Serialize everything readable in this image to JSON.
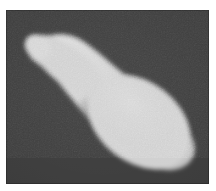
{
  "figure": {
    "caption": "",
    "alt_text": "Grayscale image of a light club-shaped blob on a dark gray background",
    "domain_kind": "grayscale-photograph"
  },
  "canvas": {
    "width": 216,
    "height": 191,
    "page_background": "#ffffff",
    "margin_left": 6,
    "margin_top": 10,
    "margin_right": 7,
    "margin_bottom": 7
  },
  "plate": {
    "x": 6,
    "y": 10,
    "width": 203,
    "height": 174,
    "background_color": "#3c3c3c",
    "noise_opacity": 0.42,
    "has_vignette": true,
    "edge_shadow": "rgba(0,0,0,0.22)"
  },
  "blob": {
    "name": "club-shaped-blob",
    "fill_color": "#cdcdcd",
    "fill_color_highlight": "#d8d8d8",
    "fill_color_shadow": "#bdbdbd",
    "edge_softness_px": 2.2,
    "orientation_degrees": 38,
    "description": "Elongated bulbous form resembling a bowling pin or club, thin rounded handle at upper-left tapering through a narrow neck into a broad rounded bulb at lower-right",
    "bounding_box": {
      "x": 16,
      "y": 24,
      "width": 175,
      "height": 135
    },
    "handle_tip": {
      "x": 22,
      "y": 32
    },
    "bulb_center": {
      "x": 135,
      "y": 110
    },
    "outline_path": "M 40.0 27.5 C 52.0 22.5 66.0 24.5 76.5 31.5 C 88.0 39.0 100.0 50.0 112.0 60.0 C 126.0 71.5 142.0 81.5 156.0 93.0 C 170.0 104.5 182.0 117.0 186.5 130.0 C 190.5 141.5 187.0 151.0 178.0 156.0 C 168.5 161.5 155.0 160.5 142.0 155.0 C 128.0 149.0 113.5 138.5 100.0 126.0 C 87.0 114.0 75.5 100.0 65.0 87.0 C 56.5 76.5 49.5 67.5 43.0 61.5 C 37.5 56.5 32.0 53.5 27.5 49.5 C 22.0 44.5 20.5 38.0 24.0 32.5 C 27.5 27.0 33.5 26.0 40.0 27.5 Z",
    "notch_note": "concave inflection on the lower-left side where the handle meets the bulb"
  },
  "colors": {
    "background_dark": "#3c3c3c",
    "blob_light": "#cdcdcd",
    "page_white": "#ffffff"
  }
}
